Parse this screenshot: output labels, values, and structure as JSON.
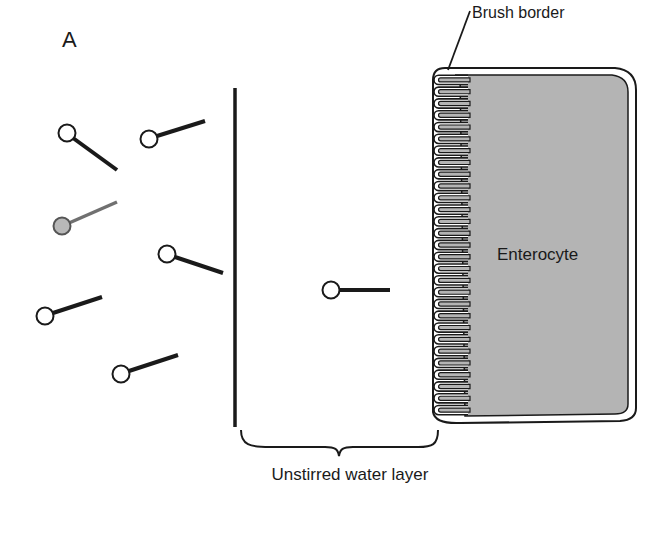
{
  "figure": {
    "panel_letter": "A",
    "labels": {
      "brush_border": "Brush border",
      "enterocyte": "Enterocyte",
      "unstirred_water_layer": "Unstirred water layer"
    },
    "colors": {
      "line": "#1a1a1a",
      "cell_fill": "#b4b4b4",
      "gray_molecule_fill": "#b8b8b8",
      "gray_molecule_tail": "#707070",
      "background": "#ffffff"
    },
    "molecules": [
      {
        "head": [
          67,
          133
        ],
        "tail_end": [
          117,
          170
        ],
        "style": "open"
      },
      {
        "head": [
          149,
          139
        ],
        "tail_end": [
          205,
          121
        ],
        "style": "open"
      },
      {
        "head": [
          62,
          226
        ],
        "tail_end": [
          117,
          202
        ],
        "style": "gray"
      },
      {
        "head": [
          167,
          254
        ],
        "tail_end": [
          223,
          273
        ],
        "style": "open"
      },
      {
        "head": [
          45,
          316
        ],
        "tail_end": [
          102,
          297
        ],
        "style": "open"
      },
      {
        "head": [
          121,
          374
        ],
        "tail_end": [
          178,
          355
        ],
        "style": "open"
      },
      {
        "head": [
          331,
          290
        ],
        "tail_end": [
          390,
          290
        ],
        "style": "open"
      }
    ]
  }
}
